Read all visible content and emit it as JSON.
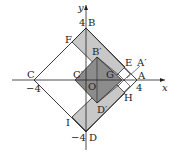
{
  "axes": {
    "x_label": "x",
    "y_label": "y",
    "origin_label": "O",
    "ticks": {
      "x_pos": "4",
      "x_neg": "−4",
      "y_pos": "4",
      "y_neg": "−4"
    }
  },
  "points": {
    "A": "A",
    "B": "B",
    "C": "C",
    "D": "D",
    "A_prime": "A′",
    "B_prime": "B′",
    "C_prime": "C′",
    "D_prime": "D′",
    "E": "E",
    "F": "F",
    "G": "G",
    "H": "H",
    "I": "I"
  },
  "colors": {
    "light_fill": "#c8c8c8",
    "dark_fill": "#8c8c8c",
    "line": "#222222"
  }
}
